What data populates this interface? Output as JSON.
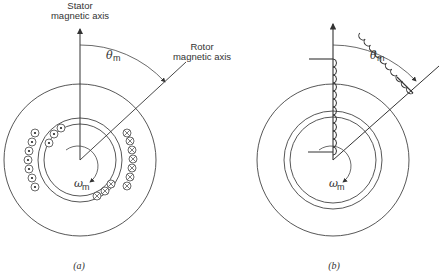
{
  "panels": [
    {
      "id": "a",
      "caption": "(a)",
      "stator_axis_label_1": "Stator",
      "stator_axis_label_2": "magnetic axis",
      "rotor_axis_label_1": "Rotor",
      "rotor_axis_label_2": "magnetic axis",
      "angle_symbol": "θ",
      "angle_sub": "m",
      "speed_symbol": "ω",
      "speed_sub": "m",
      "winding_style": "distributed conductors (dot = out, cross = in)"
    },
    {
      "id": "b",
      "caption": "(b)",
      "angle_symbol": "θ",
      "angle_sub": "m",
      "speed_symbol": "ω",
      "speed_sub": "m",
      "winding_style": "coil representation"
    }
  ],
  "colors": {
    "line": "#444444",
    "background": "#ffffff"
  }
}
